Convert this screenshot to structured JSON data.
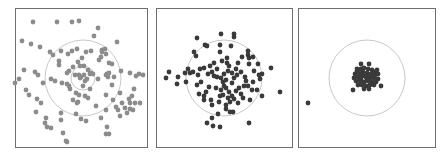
{
  "figure": {
    "panel_count": 3
  },
  "colors": {
    "frame": "#6e6e6e",
    "circle": "#c8c8c8",
    "dots_light": "#8c8c8c",
    "dots_dark": "#3a3a3a",
    "background": "#ffffff"
  },
  "chart_data": [
    {
      "type": "scatter",
      "title": "",
      "panel": 1,
      "box": [
        15,
        8,
        133,
        140
      ],
      "center": [
        83,
        78
      ],
      "rings": [
        38,
        12
      ],
      "dot_color": "#8c8c8c",
      "dot_radius": 2.4,
      "points": [
        [
          13,
          -77
        ],
        [
          -50,
          -56
        ],
        [
          -26,
          -56
        ],
        [
          -11,
          -56
        ],
        [
          -4,
          -57
        ],
        [
          -61,
          -37
        ],
        [
          -52,
          -34
        ],
        [
          -43,
          -31
        ],
        [
          -33,
          -26
        ],
        [
          -30,
          -23
        ],
        [
          -22,
          -27
        ],
        [
          -15,
          -24
        ],
        [
          -11,
          -27
        ],
        [
          -6,
          -29
        ],
        [
          -24,
          -17
        ],
        [
          -24,
          -13
        ],
        [
          -5,
          -16
        ],
        [
          -3,
          -12
        ],
        [
          1,
          -12
        ],
        [
          3,
          -26
        ],
        [
          -16,
          -5
        ],
        [
          -10,
          -11
        ],
        [
          -59,
          -8
        ],
        [
          -48,
          -6
        ],
        [
          -45,
          -3
        ],
        [
          -40,
          5
        ],
        [
          -57,
          12
        ],
        [
          -54,
          17
        ],
        [
          -46,
          21
        ],
        [
          -42,
          25
        ],
        [
          -47,
          34
        ],
        [
          -37,
          40
        ],
        [
          -38,
          45
        ],
        [
          -36,
          49
        ],
        [
          -32,
          50
        ],
        [
          -22,
          35
        ],
        [
          -22,
          42
        ],
        [
          -20,
          55
        ],
        [
          -17,
          63
        ],
        [
          -16,
          64
        ],
        [
          -64,
          1
        ],
        [
          -68,
          5
        ],
        [
          -32,
          1
        ],
        [
          -28,
          3
        ],
        [
          -21,
          5
        ],
        [
          -16,
          6
        ],
        [
          -14,
          8
        ],
        [
          -13,
          11
        ],
        [
          -7,
          15
        ],
        [
          -4,
          17
        ],
        [
          0,
          8
        ],
        [
          -6,
          25
        ],
        [
          -10,
          22
        ],
        [
          2,
          18
        ],
        [
          -7,
          36
        ],
        [
          -2,
          41
        ],
        [
          3,
          43
        ],
        [
          5,
          20
        ],
        [
          7,
          11
        ],
        [
          16,
          -18
        ],
        [
          18,
          -21
        ],
        [
          19,
          -26
        ],
        [
          19,
          -28
        ],
        [
          23,
          -24
        ],
        [
          29,
          -14
        ],
        [
          26,
          -15
        ],
        [
          24,
          -4
        ],
        [
          23,
          -3
        ],
        [
          29,
          7
        ],
        [
          23,
          17
        ],
        [
          30,
          22
        ],
        [
          37,
          15
        ],
        [
          25,
          -1
        ],
        [
          31,
          -1
        ],
        [
          38,
          -7
        ],
        [
          -2,
          -1
        ],
        [
          -4,
          -3
        ],
        [
          1,
          -3
        ],
        [
          2,
          3
        ],
        [
          4,
          1
        ],
        [
          7,
          -4
        ],
        [
          -8,
          -3
        ],
        [
          -3,
          0
        ],
        [
          10,
          -4
        ],
        [
          -14,
          -7
        ],
        [
          15,
          1
        ],
        [
          8,
          -27
        ],
        [
          13,
          28
        ],
        [
          23,
          32
        ],
        [
          18,
          40
        ],
        [
          24,
          49
        ],
        [
          23,
          56
        ],
        [
          26,
          56
        ],
        [
          33,
          29
        ],
        [
          35,
          32
        ],
        [
          37,
          38
        ],
        [
          42,
          30
        ],
        [
          44,
          35
        ],
        [
          47,
          31
        ],
        [
          47,
          -5
        ],
        [
          53,
          -2
        ],
        [
          56,
          -4
        ],
        [
          60,
          -3
        ],
        [
          51,
          11
        ],
        [
          49,
          18
        ],
        [
          47,
          25
        ],
        [
          39,
          25
        ],
        [
          52,
          25
        ],
        [
          57,
          25
        ],
        [
          50,
          32
        ],
        [
          15,
          -50
        ],
        [
          11,
          -42
        ],
        [
          22,
          -29
        ],
        [
          26,
          -5
        ],
        [
          8,
          -5
        ],
        [
          -1,
          -20
        ],
        [
          -5,
          24
        ],
        [
          34,
          -36
        ],
        [
          46,
          21
        ],
        [
          5,
          -8
        ]
      ]
    },
    {
      "type": "scatter",
      "title": "",
      "panel": 2,
      "box": [
        156,
        8,
        137,
        140
      ],
      "center": [
        224,
        78
      ],
      "rings": [
        38
      ],
      "dot_color": "#3a3a3a",
      "dot_radius": 2.4,
      "points": [
        [
          -3,
          -44
        ],
        [
          10,
          -44
        ],
        [
          10,
          -41
        ],
        [
          -27,
          -40
        ],
        [
          -19,
          -33
        ],
        [
          -17,
          -32
        ],
        [
          -4,
          -33
        ],
        [
          7,
          -32
        ],
        [
          18,
          -21
        ],
        [
          24,
          -27
        ],
        [
          24,
          -23
        ],
        [
          -30,
          -26
        ],
        [
          -4,
          -26
        ],
        [
          -2,
          -17
        ],
        [
          3,
          -15
        ],
        [
          5,
          -12
        ],
        [
          8,
          -5
        ],
        [
          14,
          -15
        ],
        [
          25,
          -14
        ],
        [
          30,
          -7
        ],
        [
          35,
          -3
        ],
        [
          -36,
          -9
        ],
        [
          -39,
          -5
        ],
        [
          -34,
          -5
        ],
        [
          -24,
          -9
        ],
        [
          -20,
          -10
        ],
        [
          -16,
          -4
        ],
        [
          -12,
          -6
        ],
        [
          -10,
          -2
        ],
        [
          -7,
          -1
        ],
        [
          -3,
          0
        ],
        [
          -1,
          4
        ],
        [
          0,
          8
        ],
        [
          2,
          10
        ],
        [
          5,
          14
        ],
        [
          8,
          18
        ],
        [
          -46,
          -1
        ],
        [
          -55,
          -6
        ],
        [
          -58,
          0
        ],
        [
          -47,
          6
        ],
        [
          -38,
          4
        ],
        [
          -26,
          -3
        ],
        [
          -23,
          4
        ],
        [
          -27,
          7
        ],
        [
          -15,
          9
        ],
        [
          -18,
          14
        ],
        [
          -20,
          18
        ],
        [
          -20,
          22
        ],
        [
          -13,
          22
        ],
        [
          -12,
          27
        ],
        [
          -5,
          24
        ],
        [
          -4,
          18
        ],
        [
          -1,
          17
        ],
        [
          4,
          20
        ],
        [
          6,
          24
        ],
        [
          10,
          21
        ],
        [
          12,
          13
        ],
        [
          8,
          5
        ],
        [
          10,
          0
        ],
        [
          13,
          -3
        ],
        [
          17,
          -6
        ],
        [
          21,
          -1
        ],
        [
          22,
          3
        ],
        [
          20,
          8
        ],
        [
          24,
          8
        ],
        [
          29,
          4
        ],
        [
          28,
          12
        ],
        [
          25,
          -20
        ],
        [
          29,
          -21
        ],
        [
          34,
          -14
        ],
        [
          38,
          -4
        ],
        [
          36,
          1
        ],
        [
          33,
          12
        ],
        [
          38,
          18
        ],
        [
          19,
          20
        ],
        [
          26,
          22
        ],
        [
          6,
          34
        ],
        [
          9,
          34
        ],
        [
          2,
          31
        ],
        [
          14,
          25
        ],
        [
          -17,
          45
        ],
        [
          -11,
          48
        ],
        [
          -4,
          49
        ],
        [
          -6,
          36
        ],
        [
          -12,
          40
        ],
        [
          2,
          27
        ],
        [
          25,
          45
        ],
        [
          56,
          14
        ],
        [
          84,
          25
        ],
        [
          47,
          -10
        ],
        [
          -28,
          -22
        ],
        [
          -31,
          -6
        ],
        [
          -25,
          16
        ],
        [
          -8,
          10
        ],
        [
          -3,
          12
        ],
        [
          2,
          2
        ],
        [
          0,
          -4
        ],
        [
          4,
          -7
        ],
        [
          15,
          10
        ],
        [
          17,
          16
        ],
        [
          -14,
          -12
        ],
        [
          -10,
          -15
        ],
        [
          -7,
          -9
        ],
        [
          12,
          -9
        ],
        [
          3,
          -20
        ]
      ]
    },
    {
      "type": "scatter",
      "title": "",
      "panel": 3,
      "box": [
        298,
        8,
        138,
        140
      ],
      "center": [
        367,
        78
      ],
      "rings": [
        38
      ],
      "dot_color": "#3a3a3a",
      "dot_radius": 2.4,
      "points": [
        [
          -6,
          -14
        ],
        [
          2,
          -14
        ],
        [
          -10,
          -7
        ],
        [
          -6,
          -9
        ],
        [
          -3,
          -10
        ],
        [
          1,
          -9
        ],
        [
          5,
          -8
        ],
        [
          8,
          -6
        ],
        [
          -12,
          -4
        ],
        [
          -8,
          -5
        ],
        [
          -4,
          -6
        ],
        [
          0,
          -5
        ],
        [
          4,
          -4
        ],
        [
          8,
          -3
        ],
        [
          11,
          -4
        ],
        [
          -13,
          0
        ],
        [
          -9,
          -1
        ],
        [
          -5,
          -2
        ],
        [
          -1,
          -1
        ],
        [
          3,
          0
        ],
        [
          7,
          0
        ],
        [
          11,
          1
        ],
        [
          -11,
          3
        ],
        [
          -7,
          3
        ],
        [
          -3,
          4
        ],
        [
          1,
          3
        ],
        [
          5,
          4
        ],
        [
          9,
          4
        ],
        [
          -9,
          7
        ],
        [
          -5,
          7
        ],
        [
          -1,
          8
        ],
        [
          3,
          7
        ],
        [
          7,
          7
        ],
        [
          -3,
          11
        ],
        [
          2,
          11
        ],
        [
          -14,
          12
        ],
        [
          14,
          8
        ],
        [
          -2,
          -2
        ],
        [
          2,
          -2
        ],
        [
          -6,
          1
        ],
        [
          6,
          -1
        ],
        [
          0,
          1
        ],
        [
          -10,
          -9
        ],
        [
          10,
          -8
        ]
      ]
    }
  ]
}
